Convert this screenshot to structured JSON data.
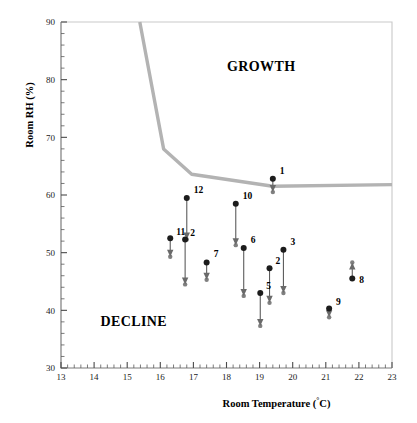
{
  "chart_data": {
    "type": "scatter",
    "title": "",
    "xlabel": "Room Temperature (°C)",
    "ylabel": "Room RH (%)",
    "xlim": [
      13,
      23
    ],
    "ylim": [
      30,
      90
    ],
    "x_major_step": 1,
    "x_minor_step": 0.2,
    "y_major_step": 10,
    "y_minor_step": 2,
    "x_tick_labels": [
      "13",
      "14",
      "15",
      "16",
      "17",
      "18",
      "19",
      "20",
      "21",
      "22",
      "23"
    ],
    "y_tick_labels": [
      "30",
      "40",
      "50",
      "60",
      "70",
      "80",
      "90"
    ],
    "grid": false,
    "legend": "none",
    "annotations": [
      {
        "text": "GROWTH",
        "x": 19.05,
        "y": 81.5
      },
      {
        "text": "DECLINE",
        "x": 15.2,
        "y": 37.2
      }
    ],
    "threshold_curve": {
      "name": "growth/decline threshold",
      "color": "#b3b3b3",
      "points": [
        {
          "x": 15.38,
          "y": 90.0
        },
        {
          "x": 16.1,
          "y": 68.0
        },
        {
          "x": 16.95,
          "y": 63.6
        },
        {
          "x": 19.4,
          "y": 61.5
        },
        {
          "x": 23.0,
          "y": 61.8
        }
      ]
    },
    "series": [
      {
        "name": "mould sample arrows",
        "marker": "filled-circle",
        "marker_color": "#1c1c1c",
        "arrow_color": "#6a6a6a",
        "points": [
          {
            "label": "1",
            "x": 19.4,
            "y_start": 62.8,
            "y_end": 60.5,
            "direction": "down",
            "label_dx": 7,
            "label_dy": -5
          },
          {
            "label": "12",
            "x": 16.8,
            "y_start": 59.5,
            "y_end": 52.3,
            "direction": "down",
            "label_dx": 7,
            "label_dy": -5
          },
          {
            "label": "10",
            "x": 18.28,
            "y_start": 58.5,
            "y_end": 51.3,
            "direction": "down",
            "label_dx": 7,
            "label_dy": -5
          },
          {
            "label": "11",
            "x": 16.3,
            "y_start": 52.5,
            "y_end": 49.3,
            "direction": "down",
            "label_dx": 6,
            "label_dy": -3
          },
          {
            "label": "2",
            "x": 16.75,
            "y_start": 52.3,
            "y_end": 44.5,
            "direction": "down",
            "label_dx": 5,
            "label_dy": -3
          },
          {
            "label": "7",
            "x": 17.4,
            "y_start": 48.3,
            "y_end": 45.3,
            "direction": "down",
            "label_dx": 7,
            "label_dy": -5
          },
          {
            "label": "6",
            "x": 18.52,
            "y_start": 50.8,
            "y_end": 42.5,
            "direction": "down",
            "label_dx": 7,
            "label_dy": -5
          },
          {
            "label": "3",
            "x": 19.72,
            "y_start": 50.5,
            "y_end": 43.0,
            "direction": "down",
            "label_dx": 7,
            "label_dy": -5
          },
          {
            "label": "2",
            "x": 19.3,
            "y_start": 47.3,
            "y_end": 41.3,
            "direction": "down",
            "label_dx": 6,
            "label_dy": -4
          },
          {
            "label": "5",
            "x": 19.02,
            "y_start": 43.0,
            "y_end": 37.3,
            "direction": "down",
            "label_dx": 6,
            "label_dy": -4
          },
          {
            "label": "9",
            "x": 21.1,
            "y_start": 40.3,
            "y_end": 38.8,
            "direction": "down",
            "label_dx": 7,
            "label_dy": -4
          },
          {
            "label": "8",
            "x": 21.8,
            "y_start": 45.5,
            "y_end": 48.3,
            "direction": "up",
            "label_dx": 7,
            "label_dy": 4
          }
        ]
      }
    ]
  }
}
